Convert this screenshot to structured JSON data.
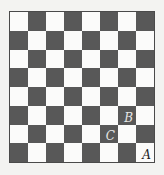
{
  "board": {
    "rows": 8,
    "cols": 8,
    "top_left": "light",
    "colors": {
      "light": "#fbfbfa",
      "dark": "#585858",
      "border": "#4a4a4a"
    },
    "labels": [
      {
        "text": "B",
        "row": 5,
        "col": 6
      },
      {
        "text": "C",
        "row": 6,
        "col": 5
      },
      {
        "text": "A",
        "row": 7,
        "col": 7
      }
    ]
  }
}
